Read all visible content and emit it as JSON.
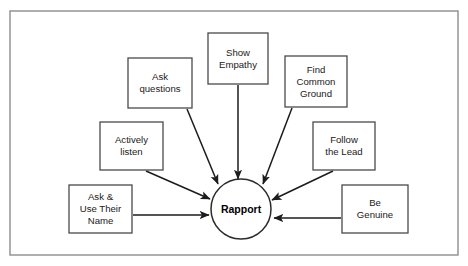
{
  "diagram": {
    "type": "hub-and-spoke",
    "colors": {
      "frame_border": "#8d8d8d",
      "node_border": "#4a4a4a",
      "connector": "#1c1c1c",
      "background": "#ffffff",
      "text": "#1a1a1a"
    },
    "hub": {
      "label": "Rapport",
      "shape": "circle",
      "cx": 241,
      "cy": 209,
      "r": 30
    },
    "nodes": [
      {
        "id": "ask-questions",
        "lines": [
          "Ask",
          "questions"
        ],
        "x": 128,
        "y": 58,
        "w": 64,
        "h": 50
      },
      {
        "id": "show-empathy",
        "lines": [
          "Show",
          "Empathy"
        ],
        "x": 208,
        "y": 33,
        "w": 60,
        "h": 51
      },
      {
        "id": "find-common-ground",
        "lines": [
          "Find",
          "Common",
          "Ground"
        ],
        "x": 285,
        "y": 56,
        "w": 62,
        "h": 51
      },
      {
        "id": "actively-listen",
        "lines": [
          "Actively",
          "listen"
        ],
        "x": 100,
        "y": 122,
        "w": 63,
        "h": 48
      },
      {
        "id": "follow-the-lead",
        "lines": [
          "Follow",
          "the Lead"
        ],
        "x": 313,
        "y": 122,
        "w": 62,
        "h": 48
      },
      {
        "id": "ask-use-their-name",
        "lines": [
          "Ask &",
          "Use Their",
          "Name"
        ],
        "x": 69,
        "y": 185,
        "w": 63,
        "h": 48
      },
      {
        "id": "be-genuine",
        "lines": [
          "Be",
          "Genuine"
        ],
        "x": 342,
        "y": 185,
        "w": 66,
        "h": 48
      }
    ],
    "connectors": [
      {
        "id": "ask-questions-to-hub",
        "from": "ask-questions",
        "to": "hub",
        "x1": 187,
        "y1": 109,
        "x2": 218,
        "y2": 184
      },
      {
        "id": "show-empathy-to-hub",
        "from": "show-empathy",
        "to": "hub",
        "x1": 238,
        "y1": 85,
        "x2": 238,
        "y2": 179
      },
      {
        "id": "find-common-ground-to-hub",
        "from": "find-common-ground",
        "to": "hub",
        "x1": 292,
        "y1": 108,
        "x2": 263,
        "y2": 184
      },
      {
        "id": "actively-listen-to-hub",
        "from": "actively-listen",
        "to": "hub",
        "x1": 146,
        "y1": 171,
        "x2": 210,
        "y2": 199
      },
      {
        "id": "follow-the-lead-to-hub",
        "from": "follow-the-lead",
        "to": "hub",
        "x1": 333,
        "y1": 171,
        "x2": 272,
        "y2": 200
      },
      {
        "id": "ask-use-their-name-to-hub",
        "from": "ask-use-their-name",
        "to": "hub",
        "x1": 133,
        "y1": 215,
        "x2": 209,
        "y2": 215
      },
      {
        "id": "be-genuine-to-hub",
        "from": "be-genuine",
        "to": "hub",
        "x1": 341,
        "y1": 218,
        "x2": 274,
        "y2": 218
      }
    ],
    "frame": {
      "x": 10,
      "y": 11,
      "w": 448,
      "h": 244
    }
  }
}
